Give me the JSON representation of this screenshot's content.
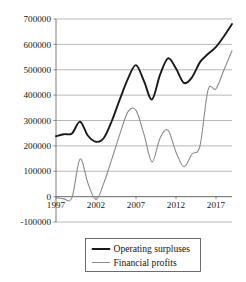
{
  "chart_data": {
    "type": "line",
    "title": "",
    "subtitle": "",
    "xlabel": "",
    "ylabel": "",
    "grid": true,
    "legend_position": "bottom-center",
    "xlim": [
      1997,
      2019
    ],
    "ylim": [
      -100000,
      700000
    ],
    "y_ticks": [
      -100000,
      0,
      100000,
      200000,
      300000,
      400000,
      500000,
      600000,
      700000
    ],
    "y_tick_labels": [
      "-100000",
      "0",
      "100000",
      "200000",
      "300000",
      "400000",
      "500000",
      "600000",
      "700000"
    ],
    "x_ticks": [
      1997,
      2002,
      2007,
      2012,
      2017
    ],
    "x_tick_labels": [
      "1997",
      "2002",
      "2007",
      "2012",
      "2017"
    ],
    "x": [
      1997,
      1998,
      1999,
      2000,
      2001,
      2002,
      2003,
      2004,
      2005,
      2006,
      2007,
      2008,
      2009,
      2010,
      2011,
      2012,
      2013,
      2014,
      2015,
      2016,
      2017,
      2018,
      2019
    ],
    "series": [
      {
        "name": "Operating surpluses",
        "color": "#1a1a1a",
        "width": 1.9,
        "values": [
          238000,
          246000,
          249000,
          295000,
          240000,
          216000,
          232000,
          300000,
          385000,
          465000,
          518000,
          455000,
          383000,
          480000,
          545000,
          505000,
          448000,
          470000,
          530000,
          562000,
          590000,
          632000,
          680000
        ]
      },
      {
        "name": "Financial profits",
        "color": "#8a8a8a",
        "width": 1.1,
        "values": [
          -3000,
          -9000,
          -4000,
          148000,
          52000,
          -12000,
          55000,
          150000,
          248000,
          335000,
          340000,
          245000,
          137000,
          230000,
          262000,
          175000,
          118000,
          168000,
          200000,
          420000,
          425000,
          500000,
          575000
        ]
      }
    ],
    "legend_entries": [
      {
        "label": "Operating surpluses",
        "color": "#1a1a1a",
        "width": 1.9
      },
      {
        "label": "Financial profits",
        "color": "#8a8a8a",
        "width": 1.1
      }
    ]
  }
}
